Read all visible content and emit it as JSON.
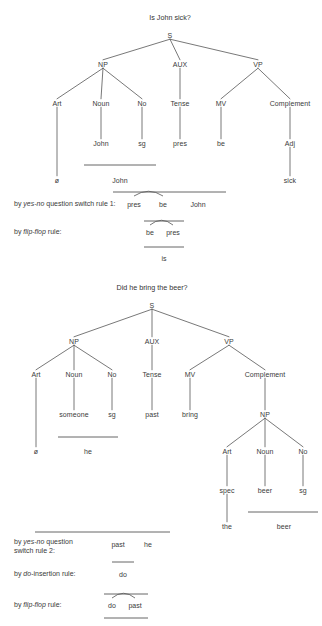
{
  "page": {
    "document_type": "syntax-derivation-figure",
    "width": 322,
    "height": 626,
    "line_color": "#555555",
    "text_color": "#3a3a3a",
    "background_color": "#ffffff"
  },
  "derivations": [
    {
      "id": "derivation-1",
      "title": "Is John sick?",
      "tree": {
        "nodes": [
          {
            "id": "d1-s",
            "label": "S",
            "x": 170,
            "y": 35
          },
          {
            "id": "d1-np",
            "label": "NP",
            "x": 103,
            "y": 64
          },
          {
            "id": "d1-aux",
            "label": "AUX",
            "x": 180,
            "y": 64
          },
          {
            "id": "d1-vp",
            "label": "VP",
            "x": 258,
            "y": 64
          },
          {
            "id": "d1-art",
            "label": "Art",
            "x": 57,
            "y": 103
          },
          {
            "id": "d1-noun",
            "label": "Noun",
            "x": 101,
            "y": 103
          },
          {
            "id": "d1-no",
            "label": "No",
            "x": 142,
            "y": 103
          },
          {
            "id": "d1-tense",
            "label": "Tense",
            "x": 180,
            "y": 103
          },
          {
            "id": "d1-mv",
            "label": "MV",
            "x": 221,
            "y": 103
          },
          {
            "id": "d1-complement",
            "label": "Complement",
            "x": 290,
            "y": 103
          },
          {
            "id": "d1-john",
            "label": "John",
            "x": 101,
            "y": 143
          },
          {
            "id": "d1-sg",
            "label": "sg",
            "x": 142,
            "y": 143
          },
          {
            "id": "d1-pres",
            "label": "pres",
            "x": 180,
            "y": 143
          },
          {
            "id": "d1-be",
            "label": "be",
            "x": 221,
            "y": 143
          },
          {
            "id": "d1-adj",
            "label": "Adj",
            "x": 290,
            "y": 143
          },
          {
            "id": "d1-null",
            "label": "ø",
            "x": 57,
            "y": 180
          },
          {
            "id": "d1-johnsurf",
            "label": "John",
            "x": 120,
            "y": 180
          },
          {
            "id": "d1-sick",
            "label": "sick",
            "x": 290,
            "y": 180
          }
        ],
        "edges": [
          [
            "d1-s",
            "d1-np"
          ],
          [
            "d1-s",
            "d1-aux"
          ],
          [
            "d1-s",
            "d1-vp"
          ],
          [
            "d1-np",
            "d1-art"
          ],
          [
            "d1-np",
            "d1-noun"
          ],
          [
            "d1-np",
            "d1-no"
          ],
          [
            "d1-aux",
            "d1-tense"
          ],
          [
            "d1-vp",
            "d1-mv"
          ],
          [
            "d1-vp",
            "d1-complement"
          ],
          [
            "d1-noun",
            "d1-john"
          ],
          [
            "d1-no",
            "d1-sg"
          ],
          [
            "d1-tense",
            "d1-pres"
          ],
          [
            "d1-mv",
            "d1-be"
          ],
          [
            "d1-complement",
            "d1-adj"
          ],
          [
            "d1-art",
            "d1-null"
          ],
          [
            "d1-adj",
            "d1-sick"
          ]
        ],
        "collapse_bars": [
          {
            "id": "d1-bar-john",
            "x1": 84,
            "x2": 156,
            "y": 165
          }
        ]
      },
      "rules": [
        {
          "id": "d1-rule-1",
          "label_html": "by <em>yes-no</em> question switch rule 1:",
          "label_x": 14,
          "label_y": 204,
          "bar": {
            "x1": 113,
            "x2": 226,
            "y": 192
          },
          "tokens": [
            {
              "text": "pres",
              "x": 134,
              "y": 204
            },
            {
              "text": "be",
              "x": 163,
              "y": 204
            },
            {
              "text": "John",
              "x": 198,
              "y": 204
            }
          ],
          "swap_arc": {
            "x1": 134,
            "x2": 163,
            "y": 196,
            "depth": 5
          }
        },
        {
          "id": "d1-rule-2",
          "label_html": "by <em>flip-flop</em> rule:",
          "label_x": 14,
          "label_y": 232,
          "bar": {
            "x1": 144,
            "x2": 184,
            "y": 221
          },
          "tokens": [
            {
              "text": "be",
              "x": 150,
              "y": 232
            },
            {
              "text": "pres",
              "x": 173,
              "y": 232
            }
          ],
          "swap_arc": {
            "x1": 150,
            "x2": 173,
            "y": 225,
            "depth": 5
          }
        }
      ],
      "result": {
        "bar": {
          "x1": 144,
          "x2": 184,
          "y": 247
        },
        "token": {
          "text": "is",
          "x": 164,
          "y": 258
        }
      }
    },
    {
      "id": "derivation-2",
      "title": "Did he bring the beer?",
      "tree": {
        "nodes": [
          {
            "id": "d2-s",
            "label": "S",
            "x": 152,
            "y": 305
          },
          {
            "id": "d2-np",
            "label": "NP",
            "x": 74,
            "y": 341
          },
          {
            "id": "d2-aux",
            "label": "AUX",
            "x": 152,
            "y": 341
          },
          {
            "id": "d2-vp",
            "label": "VP",
            "x": 229,
            "y": 341
          },
          {
            "id": "d2-art",
            "label": "Art",
            "x": 36,
            "y": 374
          },
          {
            "id": "d2-noun",
            "label": "Noun",
            "x": 74,
            "y": 374
          },
          {
            "id": "d2-no",
            "label": "No",
            "x": 112,
            "y": 374
          },
          {
            "id": "d2-tense",
            "label": "Tense",
            "x": 152,
            "y": 374
          },
          {
            "id": "d2-mv",
            "label": "MV",
            "x": 190,
            "y": 374
          },
          {
            "id": "d2-complement",
            "label": "Complement",
            "x": 265,
            "y": 374
          },
          {
            "id": "d2-someone",
            "label": "someone",
            "x": 74,
            "y": 414
          },
          {
            "id": "d2-sg",
            "label": "sg",
            "x": 112,
            "y": 414
          },
          {
            "id": "d2-past",
            "label": "past",
            "x": 152,
            "y": 414
          },
          {
            "id": "d2-bring",
            "label": "bring",
            "x": 190,
            "y": 414
          },
          {
            "id": "d2-innerNP",
            "label": "NP",
            "x": 265,
            "y": 414
          },
          {
            "id": "d2-null",
            "label": "ø",
            "x": 36,
            "y": 451
          },
          {
            "id": "d2-he",
            "label": "he",
            "x": 88,
            "y": 451
          },
          {
            "id": "d2-art2",
            "label": "Art",
            "x": 227,
            "y": 451
          },
          {
            "id": "d2-noun2",
            "label": "Noun",
            "x": 265,
            "y": 451
          },
          {
            "id": "d2-no2",
            "label": "No",
            "x": 303,
            "y": 451
          },
          {
            "id": "d2-spec",
            "label": "spec",
            "x": 227,
            "y": 490
          },
          {
            "id": "d2-beer",
            "label": "beer",
            "x": 265,
            "y": 490
          },
          {
            "id": "d2-sg2",
            "label": "sg",
            "x": 303,
            "y": 490
          },
          {
            "id": "d2-the",
            "label": "the",
            "x": 227,
            "y": 526
          },
          {
            "id": "d2-beersurf",
            "label": "beer",
            "x": 284,
            "y": 526
          }
        ],
        "edges": [
          [
            "d2-s",
            "d2-np"
          ],
          [
            "d2-s",
            "d2-aux"
          ],
          [
            "d2-s",
            "d2-vp"
          ],
          [
            "d2-np",
            "d2-art"
          ],
          [
            "d2-np",
            "d2-noun"
          ],
          [
            "d2-np",
            "d2-no"
          ],
          [
            "d2-aux",
            "d2-tense"
          ],
          [
            "d2-vp",
            "d2-mv"
          ],
          [
            "d2-vp",
            "d2-complement"
          ],
          [
            "d2-noun",
            "d2-someone"
          ],
          [
            "d2-no",
            "d2-sg"
          ],
          [
            "d2-tense",
            "d2-past"
          ],
          [
            "d2-mv",
            "d2-bring"
          ],
          [
            "d2-complement",
            "d2-innerNP"
          ],
          [
            "d2-art",
            "d2-null"
          ],
          [
            "d2-innerNP",
            "d2-art2"
          ],
          [
            "d2-innerNP",
            "d2-noun2"
          ],
          [
            "d2-innerNP",
            "d2-no2"
          ],
          [
            "d2-art2",
            "d2-spec"
          ],
          [
            "d2-noun2",
            "d2-beer"
          ],
          [
            "d2-no2",
            "d2-sg2"
          ],
          [
            "d2-spec",
            "d2-the"
          ]
        ],
        "collapse_bars": [
          {
            "id": "d2-bar-he",
            "x1": 58,
            "x2": 118,
            "y": 437
          },
          {
            "id": "d2-bar-beer",
            "x1": 248,
            "x2": 318,
            "y": 512
          }
        ]
      },
      "rules": [
        {
          "id": "d2-rule-1",
          "label_html": "by <em>yes-no</em> question<br>switch rule 2:",
          "label_x": 14,
          "label_y": 542,
          "bar": {
            "x1": 35,
            "x2": 170,
            "y": 532
          },
          "tokens": [
            {
              "text": "past",
              "x": 118,
              "y": 544
            },
            {
              "text": "he",
              "x": 148,
              "y": 544
            }
          ],
          "swap_arc": null
        },
        {
          "id": "d2-rule-2",
          "label_html": "by <em>do</em>-insertion rule:",
          "label_x": 14,
          "label_y": 574,
          "bar": {
            "x1": 112,
            "x2": 134,
            "y": 562
          },
          "tokens": [
            {
              "text": "do",
              "x": 123,
              "y": 574
            }
          ],
          "swap_arc": null
        },
        {
          "id": "d2-rule-3",
          "label_html": "by <em>flip-flop</em> rule:",
          "label_x": 14,
          "label_y": 605,
          "bar": {
            "x1": 104,
            "x2": 148,
            "y": 594
          },
          "tokens": [
            {
              "text": "do",
              "x": 112,
              "y": 605
            },
            {
              "text": "past",
              "x": 135,
              "y": 605
            }
          ],
          "swap_arc": {
            "x1": 112,
            "x2": 135,
            "y": 598,
            "depth": 5
          }
        }
      ],
      "result": {
        "bar": {
          "x1": 104,
          "x2": 148,
          "y": 618
        },
        "token": null
      }
    }
  ]
}
